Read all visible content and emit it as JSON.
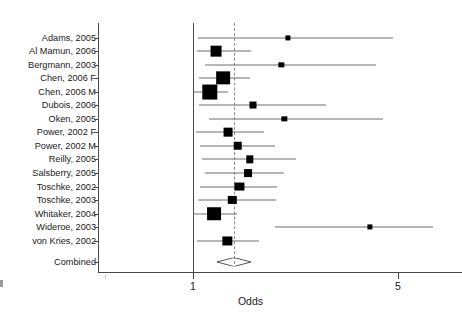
{
  "chart_data": {
    "type": "forest",
    "title": "",
    "xlabel": "Odds",
    "ylabel": "",
    "xscale": "log",
    "xlim": [
      0.72,
      7.2
    ],
    "grid": false,
    "legend": null,
    "xticks": [
      {
        "value": 1,
        "label": "1"
      },
      {
        "value": 5,
        "label": "5"
      }
    ],
    "reference_lines": [
      {
        "value": 1.0,
        "style": "solid",
        "name": "null-line"
      },
      {
        "value": 1.38,
        "style": "dashed",
        "name": "pooled-estimate-line"
      }
    ],
    "categories": [
      "Adams, 2005",
      "Al Mamun, 2006",
      "Bergmann, 2003",
      "Chen, 2006 F",
      "Chen, 2006 M",
      "Dubois, 2006",
      "Oken, 2005",
      "Power, 2002 F",
      "Power, 2002 M",
      "Reilly, 2005",
      "Salsberry, 2005",
      "Toschke, 2002",
      "Toschke, 2003",
      "Whitaker, 2004",
      "Wideroe, 2003",
      "von Kries, 2002"
    ],
    "studies": [
      {
        "label": "Adams, 2005",
        "odds": 2.1,
        "ci_low": 1.04,
        "ci_high": 4.8,
        "weight": 0.06
      },
      {
        "label": "Al Mamun, 2006",
        "odds": 1.2,
        "ci_low": 1.03,
        "ci_high": 1.58,
        "weight": 0.56
      },
      {
        "label": "Bergmann, 2003",
        "odds": 2.0,
        "ci_low": 1.1,
        "ci_high": 4.2,
        "weight": 0.07
      },
      {
        "label": "Chen, 2006 F",
        "odds": 1.27,
        "ci_low": 1.05,
        "ci_high": 1.56,
        "weight": 0.8
      },
      {
        "label": "Chen, 2006 M",
        "odds": 1.14,
        "ci_low": 1.0,
        "ci_high": 1.32,
        "weight": 0.95
      },
      {
        "label": "Dubois, 2006",
        "odds": 1.6,
        "ci_low": 1.05,
        "ci_high": 2.85,
        "weight": 0.22
      },
      {
        "label": "Oken, 2005",
        "odds": 2.05,
        "ci_low": 1.13,
        "ci_high": 4.45,
        "weight": 0.07
      },
      {
        "label": "Power, 2002 F",
        "odds": 1.32,
        "ci_low": 1.02,
        "ci_high": 1.74,
        "weight": 0.38
      },
      {
        "label": "Power, 2002 M",
        "odds": 1.42,
        "ci_low": 1.06,
        "ci_high": 1.9,
        "weight": 0.36
      },
      {
        "label": "Reilly, 2005",
        "odds": 1.56,
        "ci_low": 1.07,
        "ci_high": 2.25,
        "weight": 0.25
      },
      {
        "label": "Salsberry, 2005",
        "odds": 1.54,
        "ci_low": 1.1,
        "ci_high": 2.05,
        "weight": 0.3
      },
      {
        "label": "Toschke, 2002",
        "odds": 1.44,
        "ci_low": 1.06,
        "ci_high": 1.94,
        "weight": 0.4
      },
      {
        "label": "Toschke, 2003",
        "odds": 1.36,
        "ci_low": 1.04,
        "ci_high": 1.92,
        "weight": 0.34
      },
      {
        "label": "Whitaker, 2004",
        "odds": 1.18,
        "ci_low": 1.0,
        "ci_high": 1.41,
        "weight": 0.82
      },
      {
        "label": "Wideroe, 2003",
        "odds": 4.0,
        "ci_low": 1.9,
        "ci_high": 6.6,
        "weight": 0.06
      },
      {
        "label": "von Kries, 2002",
        "odds": 1.31,
        "ci_low": 1.03,
        "ci_high": 1.68,
        "weight": 0.42
      }
    ],
    "combined": {
      "label": "Combined",
      "odds": 1.38,
      "ci_low": 1.28,
      "ci_high": 1.5
    }
  }
}
